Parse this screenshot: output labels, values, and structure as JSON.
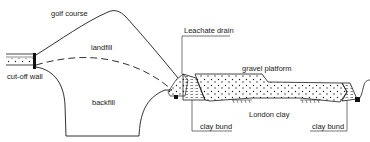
{
  "diagram": {
    "type": "cross-section",
    "labels": {
      "golf_course": "golf course",
      "landfill": "landfill",
      "cut_off_wall": "cut-off wall",
      "backfill": "backfill",
      "leachate_drain": "Leachate drain",
      "gravel_platform": "gravel platform",
      "london_clay": "London clay",
      "clay_bund_left": "clay bund",
      "clay_bund_right": "clay bund"
    },
    "colors": {
      "line": "#1a1a1a",
      "background": "#ffffff",
      "fill_dots": "#1a1a1a"
    }
  }
}
